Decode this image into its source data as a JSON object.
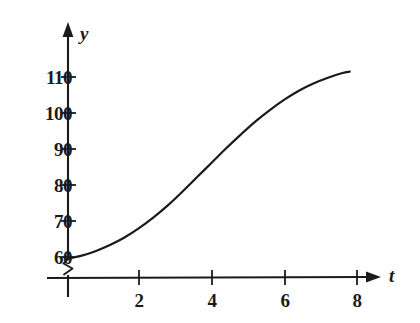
{
  "figure": {
    "background_color": "#ffffff",
    "ink_color": "#1a1a1a"
  },
  "chart_data": {
    "type": "line",
    "title": "",
    "subtitle": "",
    "xlabel": "t",
    "ylabel": "y",
    "xlim": [
      0,
      8.6
    ],
    "ylim": [
      58,
      116
    ],
    "grid": false,
    "legend": null,
    "axis_break": {
      "axis": "y",
      "symbol": "zigzag",
      "between": [
        0,
        58
      ],
      "note": "y-axis broken below 60"
    },
    "x_ticks": [
      2,
      4,
      6,
      8
    ],
    "x_tick_labels": [
      "2",
      "4",
      "6",
      "8"
    ],
    "y_ticks": [
      60,
      70,
      80,
      90,
      100,
      110
    ],
    "y_tick_labels": [
      "60",
      "70",
      "80",
      "90",
      "100",
      "110"
    ],
    "x_axis_arrow": true,
    "y_axis_arrow": true,
    "series": [
      {
        "name": "y",
        "style": "solid",
        "color": "#1a1a1a",
        "width": 2.2,
        "x": [
          0,
          0.4,
          0.8,
          1.2,
          1.6,
          2.0,
          2.4,
          2.8,
          3.2,
          3.6,
          4.0,
          4.4,
          4.8,
          5.2,
          5.6,
          6.0,
          6.4,
          6.8,
          7.2,
          7.6,
          7.8
        ],
        "values": [
          59.5,
          60.3,
          61.6,
          63.3,
          65.4,
          68.0,
          71.0,
          74.4,
          78.2,
          82.2,
          86.2,
          90.2,
          94.0,
          97.6,
          100.8,
          103.7,
          106.2,
          108.2,
          109.8,
          111.1,
          111.5
        ]
      }
    ],
    "annotations": []
  }
}
